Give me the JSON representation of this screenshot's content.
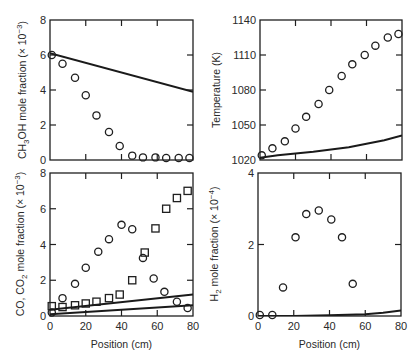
{
  "chart_data": [
    {
      "id": "ch3oh",
      "type": "scatter",
      "panel": "top-left",
      "xlabel": "",
      "ylabel": "CH3OH mole fraction (× 10^-3)",
      "ylabel_parts": {
        "pre": "CH",
        "sub": "3",
        "post": "OH mole fraction (× 10",
        "sup": "−3",
        "end": ")"
      },
      "xlim": [
        0,
        80
      ],
      "ylim": [
        0,
        8
      ],
      "xticks": [
        0,
        20,
        40,
        60,
        80
      ],
      "yticks": [
        0,
        2,
        4,
        6,
        8
      ],
      "xtick_labels_visible": false,
      "series": [
        {
          "name": "measured",
          "marker": "circle",
          "x": [
            1,
            7,
            14,
            20,
            26,
            33,
            39,
            46,
            52,
            59,
            65,
            72,
            78
          ],
          "y": [
            6.0,
            5.5,
            4.7,
            3.7,
            2.55,
            1.6,
            0.8,
            0.25,
            0.15,
            0.15,
            0.12,
            0.12,
            0.12
          ]
        },
        {
          "name": "model",
          "marker": "line",
          "x": [
            0,
            80
          ],
          "y": [
            6.1,
            3.9
          ]
        }
      ]
    },
    {
      "id": "temperature",
      "type": "scatter",
      "panel": "top-right",
      "xlabel": "",
      "ylabel": "Temperature (K)",
      "xlim": [
        0,
        80
      ],
      "ylim": [
        1020,
        1140
      ],
      "xticks": [
        0,
        20,
        40,
        60,
        80
      ],
      "yticks": [
        1020,
        1050,
        1080,
        1110,
        1140
      ],
      "xtick_labels_visible": false,
      "series": [
        {
          "name": "measured",
          "marker": "circle",
          "x": [
            1,
            7,
            14,
            20,
            26,
            33,
            39,
            46,
            52,
            59,
            65,
            72,
            78
          ],
          "y": [
            1024,
            1030,
            1036,
            1047,
            1057,
            1068,
            1080,
            1092,
            1102,
            1110,
            1118,
            1125,
            1128
          ]
        },
        {
          "name": "model",
          "marker": "line",
          "x": [
            0,
            10,
            20,
            30,
            40,
            50,
            60,
            70,
            80
          ],
          "y": [
            1022,
            1024,
            1025.5,
            1027,
            1029,
            1031,
            1034,
            1037,
            1041
          ]
        }
      ]
    },
    {
      "id": "co-co2",
      "type": "scatter",
      "panel": "bottom-left",
      "xlabel": "Position (cm)",
      "ylabel": "CO, CO2 mole fraction (× 10^-3)",
      "ylabel_parts": {
        "pre": "CO, CO",
        "sub": "2",
        "post": " mole fraction (× 10",
        "sup": "−3",
        "end": ")"
      },
      "xlim": [
        0,
        80
      ],
      "ylim": [
        0,
        8
      ],
      "xticks": [
        0,
        20,
        40,
        60,
        80
      ],
      "yticks": [
        0,
        2,
        4,
        6,
        8
      ],
      "xtick_labels_visible": true,
      "series": [
        {
          "name": "CO measured",
          "marker": "circle",
          "x": [
            1,
            7,
            14,
            20,
            27,
            33,
            40,
            46,
            52,
            58,
            64,
            71,
            77
          ],
          "y": [
            0.2,
            1.0,
            1.8,
            2.7,
            3.6,
            4.3,
            5.1,
            4.85,
            3.25,
            2.1,
            1.35,
            0.8,
            0.45
          ]
        },
        {
          "name": "CO2 measured",
          "marker": "square",
          "x": [
            1,
            7,
            14,
            20,
            26,
            33,
            39,
            46,
            53,
            59,
            65,
            71,
            77
          ],
          "y": [
            0.55,
            0.5,
            0.6,
            0.7,
            0.8,
            1.0,
            1.2,
            2.0,
            3.55,
            4.9,
            6.0,
            6.6,
            7.0
          ]
        },
        {
          "name": "CO model",
          "marker": "line",
          "x": [
            0,
            80
          ],
          "y": [
            0.35,
            1.2
          ]
        },
        {
          "name": "CO2 model",
          "marker": "line",
          "x": [
            0,
            80
          ],
          "y": [
            0.1,
            0.6
          ]
        }
      ]
    },
    {
      "id": "h2",
      "type": "scatter",
      "panel": "bottom-right",
      "xlabel": "Position (cm)",
      "ylabel": "H2 mole fraction (× 10^-4)",
      "ylabel_parts": {
        "pre": "H",
        "sub": "2",
        "post": " mole fraction (× 10",
        "sup": "−4",
        "end": ")"
      },
      "xlim": [
        0,
        80
      ],
      "ylim": [
        0,
        4
      ],
      "xticks": [
        0,
        20,
        40,
        60,
        80
      ],
      "yticks": [
        0,
        2,
        4
      ],
      "xtick_labels_visible": true,
      "series": [
        {
          "name": "measured",
          "marker": "circle",
          "x": [
            1,
            8,
            14,
            21,
            27,
            34,
            41,
            47,
            53
          ],
          "y": [
            0.03,
            0.03,
            0.8,
            2.2,
            2.85,
            2.95,
            2.7,
            2.2,
            0.9
          ]
        },
        {
          "name": "model",
          "marker": "line",
          "x": [
            0,
            20,
            40,
            60,
            70,
            80
          ],
          "y": [
            0.0,
            0.0,
            0.02,
            0.05,
            0.09,
            0.15
          ]
        }
      ]
    }
  ]
}
